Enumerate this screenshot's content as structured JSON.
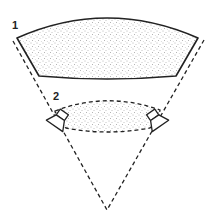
{
  "diagram": {
    "labels": {
      "large_area": "1",
      "small_area": "2"
    },
    "elements": {
      "large_area": "large stippled sound-stage area (wide listening zone)",
      "small_area": "small dashed stippled sound-stage area between speakers",
      "left_speaker": "left loudspeaker",
      "right_speaker": "right loudspeaker",
      "left_boundary": "left dashed boundary line",
      "right_boundary": "right dashed boundary line",
      "listener_vertex": "listening position at vertex"
    },
    "colors": {
      "stroke": "#222222",
      "stipple": "#555555",
      "background": "#ffffff"
    }
  }
}
